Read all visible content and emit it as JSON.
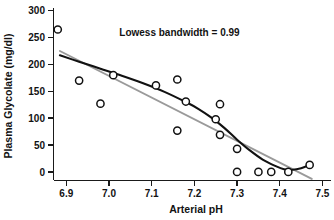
{
  "chart_data": {
    "type": "scatter",
    "title": "",
    "xlabel": "Arterial pH",
    "ylabel": "Plasma Glycolate (mg/dl)",
    "xlim": [
      6.87,
      7.52
    ],
    "ylim": [
      -15,
      305
    ],
    "xticks": [
      "6.9",
      "7.0",
      "7.1",
      "7.2",
      "7.3",
      "7.4",
      "7.5"
    ],
    "xtick_values": [
      6.9,
      7.0,
      7.1,
      7.2,
      7.3,
      7.4,
      7.5
    ],
    "yticks": [
      "0",
      "50",
      "100",
      "150",
      "200",
      "250",
      "300"
    ],
    "ytick_values": [
      0,
      50,
      100,
      150,
      200,
      250,
      300
    ],
    "grid": false,
    "legend": "none",
    "annotations": [
      {
        "text": "Lowess bandwidth = 0.99",
        "x": 7.165,
        "y": 252
      }
    ],
    "series": [
      {
        "name": "Observations",
        "type": "scatter",
        "marker": "open-circle",
        "marker_face": "#ffffff",
        "marker_edge": "#111111",
        "points": [
          {
            "x": 6.88,
            "y": 265
          },
          {
            "x": 6.93,
            "y": 170
          },
          {
            "x": 6.98,
            "y": 127
          },
          {
            "x": 7.01,
            "y": 180
          },
          {
            "x": 7.11,
            "y": 161
          },
          {
            "x": 7.16,
            "y": 172
          },
          {
            "x": 7.16,
            "y": 77
          },
          {
            "x": 7.18,
            "y": 131
          },
          {
            "x": 7.25,
            "y": 98
          },
          {
            "x": 7.26,
            "y": 126
          },
          {
            "x": 7.26,
            "y": 69
          },
          {
            "x": 7.3,
            "y": 43
          },
          {
            "x": 7.3,
            "y": 0
          },
          {
            "x": 7.35,
            "y": 0
          },
          {
            "x": 7.38,
            "y": 0
          },
          {
            "x": 7.42,
            "y": 0
          },
          {
            "x": 7.47,
            "y": 13
          }
        ]
      },
      {
        "name": "Lowess smoother",
        "type": "line",
        "color": "#111111",
        "points": [
          {
            "x": 6.885,
            "y": 217
          },
          {
            "x": 6.93,
            "y": 205
          },
          {
            "x": 6.98,
            "y": 192
          },
          {
            "x": 7.03,
            "y": 179
          },
          {
            "x": 7.08,
            "y": 165
          },
          {
            "x": 7.13,
            "y": 149
          },
          {
            "x": 7.18,
            "y": 130
          },
          {
            "x": 7.21,
            "y": 117
          },
          {
            "x": 7.24,
            "y": 101
          },
          {
            "x": 7.27,
            "y": 82
          },
          {
            "x": 7.3,
            "y": 60
          },
          {
            "x": 7.33,
            "y": 40
          },
          {
            "x": 7.36,
            "y": 23
          },
          {
            "x": 7.39,
            "y": 11
          },
          {
            "x": 7.41,
            "y": 5
          },
          {
            "x": 7.43,
            "y": 4
          },
          {
            "x": 7.45,
            "y": 7
          },
          {
            "x": 7.47,
            "y": 13
          }
        ]
      },
      {
        "name": "Reference line",
        "type": "line",
        "color": "#9a9a9a",
        "points": [
          {
            "x": 6.885,
            "y": 225
          },
          {
            "x": 7.475,
            "y": -13
          }
        ]
      }
    ]
  },
  "axes": {
    "x_title": "Arterial pH",
    "y_title": "Plasma Glycolate (mg/dl)"
  }
}
